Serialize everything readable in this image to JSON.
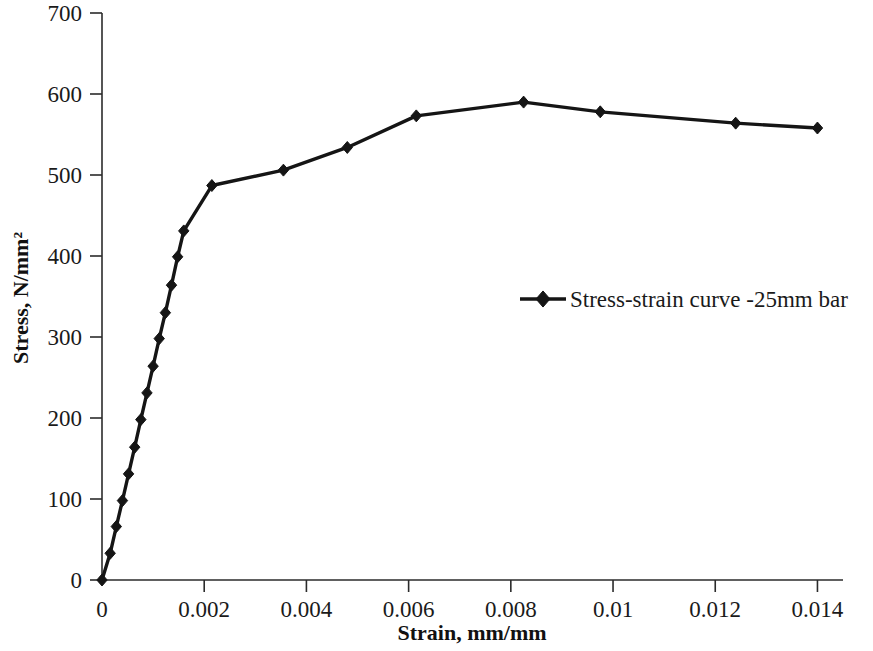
{
  "chart_data": {
    "type": "line",
    "title": "",
    "xlabel": "Strain, mm/mm",
    "ylabel": "Stress, N/mm²",
    "xlim": [
      0,
      0.0145
    ],
    "ylim": [
      0,
      700
    ],
    "xticks": [
      0,
      0.002,
      0.004,
      0.006,
      0.008,
      0.01,
      0.012,
      0.014
    ],
    "xtick_labels": [
      "0",
      "0.002",
      "0.004",
      "0.006",
      "0.008",
      "0.01",
      "0.012",
      "0.014"
    ],
    "yticks": [
      0,
      100,
      200,
      300,
      400,
      500,
      600,
      700
    ],
    "ytick_labels": [
      "0",
      "100",
      "200",
      "300",
      "400",
      "500",
      "600",
      "700"
    ],
    "grid": false,
    "legend_position": "center-right",
    "series": [
      {
        "name": "Stress-strain curve -25mm bar",
        "color": "#151515",
        "marker": "diamond",
        "x": [
          0.0,
          0.00016,
          0.00028,
          0.0004,
          0.00052,
          0.00064,
          0.00076,
          0.00088,
          0.001,
          0.00112,
          0.00124,
          0.00136,
          0.00148,
          0.0016,
          0.00215,
          0.00355,
          0.0048,
          0.00615,
          0.00825,
          0.00975,
          0.0124,
          0.014
        ],
        "y": [
          0,
          33,
          66,
          98,
          131,
          164,
          198,
          231,
          264,
          298,
          330,
          364,
          399,
          431,
          487,
          506,
          534,
          573,
          590,
          578,
          564,
          558
        ]
      }
    ]
  },
  "legend": {
    "entries": [
      {
        "label": "Stress-strain curve -25mm bar",
        "marker": "diamond-marker",
        "color": "#151515"
      }
    ]
  },
  "axes": {
    "x_title": "Strain, mm/mm",
    "y_title": "Stress, N/mm²"
  }
}
